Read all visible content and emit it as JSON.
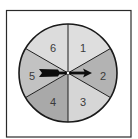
{
  "spinner": {
    "sectors": [
      {
        "label": "1",
        "color": "#dedede"
      },
      {
        "label": "2",
        "color": "#b3b3b3"
      },
      {
        "label": "3",
        "color": "#d6d6d6"
      },
      {
        "label": "4",
        "color": "#a9a9a9"
      },
      {
        "label": "5",
        "color": "#c2c2c2"
      },
      {
        "label": "6",
        "color": "#dcdcdc"
      }
    ],
    "arrow_pointing_to": "2",
    "frame_color": "#222222",
    "outline_color": "#1a1a1a"
  }
}
